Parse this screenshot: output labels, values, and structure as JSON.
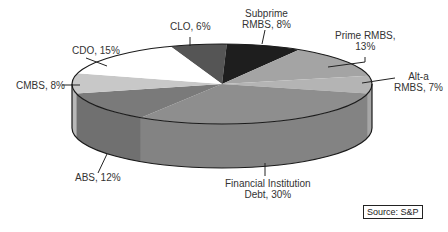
{
  "chart_data": {
    "type": "pie",
    "style": "3d-pie",
    "title": "",
    "categories": [
      "CLO",
      "Subprime RMBS",
      "Prime RMBS",
      "Alt-a RMBS",
      "Financial Institution Debt",
      "ABS",
      "CMBS",
      "CDO"
    ],
    "values": [
      6,
      8,
      13,
      7,
      30,
      12,
      8,
      15
    ],
    "unit": "%",
    "colors": [
      "#555555",
      "#1e1e1e",
      "#a4a4a4",
      "#b4b4b4",
      "#8e8e8e",
      "#7a7a7a",
      "#c8c8c8",
      "#ffffff"
    ],
    "labels": [
      "CLO, 6%",
      "Subprime RMBS, 8%",
      "Prime RMBS, 13%",
      "Alt-a RMBS, 7%",
      "Financial Institution Debt, 30%",
      "ABS, 12%",
      "CMBS, 8%",
      "CDO, 15%"
    ],
    "legend": "none (callout labels)"
  },
  "labels": {
    "clo": "CLO, 6%",
    "subprime_1": "Subprime",
    "subprime_2": "RMBS, 8%",
    "prime_1": "Prime RMBS,",
    "prime_2": "13%",
    "alta_1": "Alt-a",
    "alta_2": "RMBS, 7%",
    "fid_1": "Financial Institution",
    "fid_2": "Debt, 30%",
    "abs": "ABS, 12%",
    "cmbs": "CMBS, 8%",
    "cdo": "CDO, 15%"
  },
  "source": "Source:  S&P"
}
